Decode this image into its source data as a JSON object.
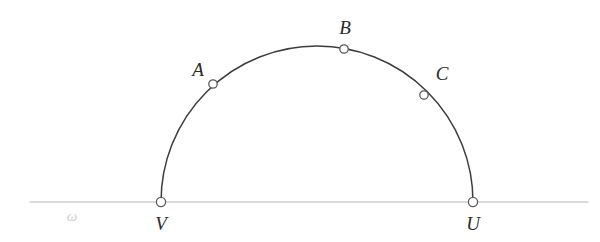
{
  "figure": {
    "background_color": "#ffffff",
    "width": 600,
    "height": 242,
    "baseline": {
      "name": "omega",
      "label": "ω",
      "label_x": 72,
      "label_y": 216,
      "color": "#cfcfcf",
      "x_start": 30,
      "x_end": 588,
      "y": 202,
      "stroke_width": 1.4
    },
    "arc": {
      "name": "semicircle-VU",
      "color": "#3c3c3c",
      "stroke_width": 1.5,
      "center_x": 317,
      "center_y": 202,
      "radius": 156,
      "start_x": 161,
      "start_y": 202,
      "end_x": 473,
      "end_y": 202,
      "apex_x": 317,
      "apex_y": 46
    },
    "points": [
      {
        "id": "A",
        "label": "A",
        "cx": 213,
        "cy": 84,
        "r": 4.2,
        "label_x": 198,
        "label_y": 69,
        "fill": "#ffffff",
        "stroke": "#5a5a5a"
      },
      {
        "id": "B",
        "label": "B",
        "cx": 344,
        "cy": 49,
        "r": 4.2,
        "label_x": 345,
        "label_y": 27,
        "fill": "#ffffff",
        "stroke": "#5a5a5a"
      },
      {
        "id": "C",
        "label": "C",
        "cx": 424,
        "cy": 95,
        "r": 4.2,
        "label_x": 442,
        "label_y": 73,
        "fill": "#ffffff",
        "stroke": "#5a5a5a"
      },
      {
        "id": "V",
        "label": "V",
        "cx": 161,
        "cy": 202,
        "r": 4.6,
        "label_x": 161,
        "label_y": 223,
        "fill": "#ffffff",
        "stroke": "#5a5a5a"
      },
      {
        "id": "U",
        "label": "U",
        "cx": 473,
        "cy": 202,
        "r": 4.6,
        "label_x": 473,
        "label_y": 223,
        "fill": "#ffffff",
        "stroke": "#5a5a5a"
      }
    ]
  }
}
